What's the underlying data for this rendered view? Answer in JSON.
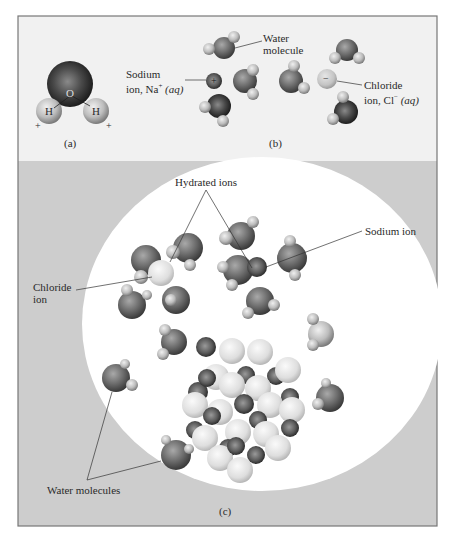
{
  "figure": {
    "panel_a": {
      "caption": "(a)",
      "oxygen_label": "O",
      "hydrogen_left_label": "H",
      "hydrogen_right_label": "H",
      "charge_negative": "−",
      "charge_positive_left": "+",
      "charge_positive_right": "+"
    },
    "panel_b": {
      "caption": "(b)",
      "water_molecule_label_line1": "Water",
      "water_molecule_label_line2": "molecule",
      "sodium_label_line1": "Sodium",
      "sodium_label_line2_prefix": "ion, Na",
      "sodium_label_sup": "+",
      "sodium_label_aq": "(aq)",
      "sodium_charge": "+",
      "chloride_label_line1": "Chloride",
      "chloride_label_line2_prefix": "ion, Cl",
      "chloride_label_sup": "−",
      "chloride_label_aq": "(aq)",
      "chloride_charge": "−"
    },
    "panel_c": {
      "caption": "(c)",
      "hydrated_ions_label": "Hydrated ions",
      "sodium_ion_label": "Sodium ion",
      "chloride_ion_label_line1": "Chloride",
      "chloride_ion_label_line2": "ion",
      "water_molecules_label": "Water molecules"
    },
    "colors": {
      "upper_panel_bg": "#f1f1f1",
      "lower_panel_bg": "#cdcdcd",
      "circle_bg": "#ffffff",
      "frame": "#777777"
    }
  }
}
